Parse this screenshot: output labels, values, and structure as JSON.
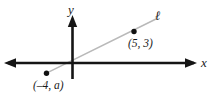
{
  "figure": {
    "type": "coordinate-plane-line-diagram",
    "axes": {
      "x_label": "x",
      "y_label": "y"
    },
    "line": {
      "name": "ℓ",
      "color": "#b3b3b3"
    },
    "points": [
      {
        "id": "point-5-3",
        "label": "(5, 3)",
        "x": 5,
        "y": 3
      },
      {
        "id": "point-n4-a",
        "label": "(–4, a)",
        "x": -4,
        "y": "a"
      }
    ],
    "colors": {
      "axis": "#1a1a1a",
      "line": "#b3b3b3",
      "point": "#111111",
      "text": "#1a1a1a",
      "background": "#ffffff"
    }
  }
}
